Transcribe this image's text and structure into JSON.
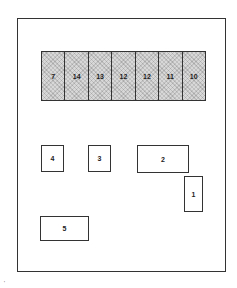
{
  "diagram": {
    "top_bar": {
      "cells": [
        "7",
        "14",
        "13",
        "12",
        "12",
        "11",
        "10"
      ],
      "fill": "hatched-gray"
    },
    "boxes": [
      {
        "id": "4",
        "label": "4"
      },
      {
        "id": "3",
        "label": "3"
      },
      {
        "id": "2",
        "label": "2"
      },
      {
        "id": "1",
        "label": "1"
      },
      {
        "id": "5",
        "label": "5"
      }
    ],
    "corner_mark": "'"
  }
}
